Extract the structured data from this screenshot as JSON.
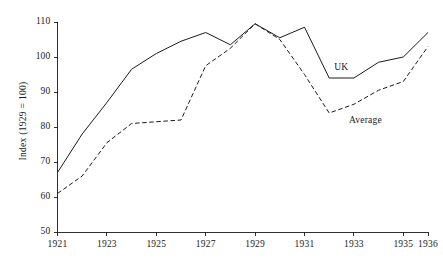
{
  "chart_data": {
    "type": "line",
    "title": "",
    "xlabel": "",
    "ylabel": "Index (1929 = 100)",
    "xlim": [
      1921,
      1936
    ],
    "ylim": [
      50,
      110
    ],
    "grid": false,
    "legend_position": "inline-annotation",
    "x": [
      1921,
      1922,
      1923,
      1924,
      1925,
      1926,
      1927,
      1928,
      1929,
      1930,
      1931,
      1932,
      1933,
      1934,
      1935,
      1936
    ],
    "xtick_labels": [
      "1921",
      "1923",
      "1925",
      "1927",
      "1929",
      "1931",
      "1933",
      "1935",
      "1936"
    ],
    "xtick_values": [
      1921,
      1923,
      1925,
      1927,
      1929,
      1931,
      1933,
      1935,
      1936
    ],
    "ytick_labels": [
      "50",
      "60",
      "70",
      "80",
      "90",
      "100",
      "110"
    ],
    "ytick_values": [
      50,
      60,
      70,
      80,
      90,
      100,
      110
    ],
    "series": [
      {
        "name": "UK",
        "style": "solid",
        "color": "#1a1a1a",
        "values": [
          67,
          78,
          87,
          96.5,
          101,
          104.5,
          107,
          103.5,
          109.5,
          105.5,
          108.5,
          94,
          94,
          98.5,
          100,
          107
        ]
      },
      {
        "name": "Average",
        "style": "dashed",
        "color": "#1a1a1a",
        "values": [
          61,
          66,
          75.5,
          81,
          81.5,
          82,
          97.5,
          102.5,
          109.5,
          105,
          95,
          84,
          86.5,
          90.5,
          93,
          103
        ]
      }
    ],
    "annotations": [
      {
        "label": "UK",
        "x": 1932.2,
        "y": 96.5
      },
      {
        "label": "Average",
        "x": 1932.8,
        "y": 81.5
      }
    ]
  }
}
